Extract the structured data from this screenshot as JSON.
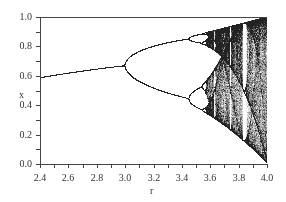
{
  "chart_data": {
    "type": "scatter",
    "title": "",
    "xlabel": "r",
    "ylabel": "x",
    "xlim": [
      2.4,
      4.0
    ],
    "ylim": [
      0.0,
      1.0
    ],
    "x_ticks": [
      "2.4",
      "2.6",
      "2.8",
      "3.0",
      "3.2",
      "3.4",
      "3.6",
      "3.8",
      "4.0"
    ],
    "y_ticks": [
      "0.0",
      "0.2",
      "0.4",
      "0.6",
      "0.8",
      "1.0"
    ],
    "grid": false,
    "legend": null,
    "key_points": [
      {
        "r": 2.4,
        "x": 0.583
      },
      {
        "r": 3.0,
        "x": 0.667,
        "note": "first period-doubling bifurcation"
      },
      {
        "r": 3.449,
        "x_values": [
          0.44,
          0.85
        ],
        "note": "period-4 bifurcation"
      },
      {
        "r": 3.57,
        "note": "onset of chaos"
      },
      {
        "r": 3.83,
        "note": "period-3 window"
      },
      {
        "r": 4.0,
        "x_range": [
          0.0,
          1.0
        ]
      }
    ],
    "point_color": "#222222"
  },
  "axes": {
    "xlabel": "r",
    "ylabel": "x",
    "x_ticks": [
      "2.4",
      "2.6",
      "2.8",
      "3.0",
      "3.2",
      "3.4",
      "3.6",
      "3.8",
      "4.0"
    ],
    "y_ticks": [
      "0.0",
      "0.2",
      "0.4",
      "0.6",
      "0.8",
      "1.0"
    ]
  }
}
